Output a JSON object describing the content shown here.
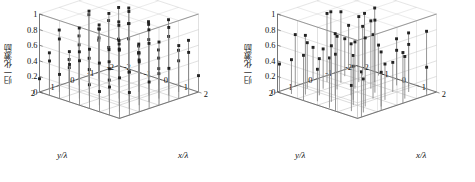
{
  "figure": {
    "background_color": "#ffffff",
    "panel_count": 2,
    "marker_color": "#222222",
    "stem_color": "#8a8a8a",
    "grid_color": "#b9b9b9",
    "axis_color": "#4a4a4a"
  },
  "chart_data": [
    {
      "type": "scatter",
      "panel": "left",
      "title": "",
      "xlabel": "x/λ",
      "ylabel": "y/λ",
      "zlabel": "归一化激励",
      "xlim": [
        -2,
        2
      ],
      "ylim": [
        -2,
        2
      ],
      "zlim": [
        0,
        1
      ],
      "xticks": [
        -2,
        -1,
        0,
        1,
        2
      ],
      "yticks": [
        -2,
        -1,
        0,
        1,
        2
      ],
      "zticks": [
        0,
        0.2,
        0.4,
        0.6,
        0.8,
        1
      ],
      "xticklabels": [
        "-2",
        "-1",
        "0",
        "1",
        "2"
      ],
      "yticklabels": [
        "-2",
        "-1",
        "0",
        "1",
        "2"
      ],
      "zticklabels": [
        "0",
        "0.2",
        "0.4",
        "0.6",
        "0.8",
        "1"
      ],
      "grid": true,
      "legend": "none",
      "points": [
        [
          -2.0,
          -2.0,
          0.34
        ],
        [
          -2.0,
          -1.5,
          0.62
        ],
        [
          -2.0,
          -1.0,
          0.41
        ],
        [
          -2.0,
          -0.5,
          0.78
        ],
        [
          -2.0,
          0.0,
          0.55
        ],
        [
          -2.0,
          0.5,
          0.29
        ],
        [
          -2.0,
          1.0,
          0.71
        ],
        [
          -2.0,
          1.5,
          0.46
        ],
        [
          -2.0,
          2.0,
          0.17
        ],
        [
          -1.5,
          -2.0,
          0.58
        ],
        [
          -1.5,
          -1.5,
          0.83
        ],
        [
          -1.5,
          -1.0,
          0.36
        ],
        [
          -1.5,
          -0.5,
          0.64
        ],
        [
          -1.5,
          0.0,
          0.91
        ],
        [
          -1.5,
          0.5,
          0.52
        ],
        [
          -1.5,
          1.0,
          0.27
        ],
        [
          -1.5,
          1.5,
          0.68
        ],
        [
          -1.5,
          2.0,
          0.44
        ],
        [
          -1.0,
          -2.0,
          0.25
        ],
        [
          -1.0,
          -1.5,
          0.47
        ],
        [
          -1.0,
          -1.0,
          0.73
        ],
        [
          -1.0,
          -0.5,
          0.88
        ],
        [
          -1.0,
          0.0,
          0.61
        ],
        [
          -1.0,
          0.5,
          0.39
        ],
        [
          -1.0,
          1.0,
          0.82
        ],
        [
          -1.0,
          1.5,
          0.56
        ],
        [
          -1.0,
          2.0,
          0.31
        ],
        [
          -0.5,
          -2.0,
          0.69
        ],
        [
          -0.5,
          -1.5,
          0.42
        ],
        [
          -0.5,
          -1.0,
          0.95
        ],
        [
          -0.5,
          -0.5,
          0.77
        ],
        [
          -0.5,
          0.0,
          0.5
        ],
        [
          -0.5,
          0.5,
          0.86
        ],
        [
          -0.5,
          1.0,
          0.33
        ],
        [
          -0.5,
          1.5,
          0.6
        ],
        [
          -0.5,
          2.0,
          0.48
        ],
        [
          0.0,
          -2.0,
          0.37
        ],
        [
          0.0,
          -1.5,
          0.74
        ],
        [
          0.0,
          -1.0,
          0.53
        ],
        [
          0.0,
          -0.5,
          0.99
        ],
        [
          0.0,
          0.0,
          0.66
        ],
        [
          0.0,
          0.5,
          0.43
        ],
        [
          0.0,
          1.0,
          0.89
        ],
        [
          0.0,
          1.5,
          0.22
        ],
        [
          0.0,
          2.0,
          0.57
        ],
        [
          0.5,
          -2.0,
          0.8
        ],
        [
          0.5,
          -1.5,
          0.35
        ],
        [
          0.5,
          -1.0,
          0.63
        ],
        [
          0.5,
          -0.5,
          0.49
        ],
        [
          0.5,
          0.0,
          0.92
        ],
        [
          0.5,
          0.5,
          0.7
        ],
        [
          0.5,
          1.0,
          0.28
        ],
        [
          0.5,
          1.5,
          0.54
        ],
        [
          0.5,
          2.0,
          0.76
        ],
        [
          1.0,
          -2.0,
          0.45
        ],
        [
          1.0,
          -1.5,
          0.67
        ],
        [
          1.0,
          -1.0,
          0.3
        ],
        [
          1.0,
          -0.5,
          0.84
        ],
        [
          1.0,
          0.0,
          0.59
        ],
        [
          1.0,
          0.5,
          0.38
        ],
        [
          1.0,
          1.0,
          0.72
        ],
        [
          1.0,
          1.5,
          0.51
        ],
        [
          1.0,
          2.0,
          0.26
        ],
        [
          1.5,
          -2.0,
          0.62
        ],
        [
          1.5,
          -1.5,
          0.4
        ],
        [
          1.5,
          -1.0,
          0.87
        ],
        [
          1.5,
          -0.5,
          0.32
        ],
        [
          1.5,
          0.0,
          0.75
        ],
        [
          1.5,
          0.5,
          0.58
        ],
        [
          1.5,
          1.0,
          0.47
        ],
        [
          1.5,
          1.5,
          0.79
        ],
        [
          1.5,
          2.0,
          0.36
        ],
        [
          2.0,
          -2.0,
          0.21
        ],
        [
          2.0,
          -1.5,
          0.55
        ],
        [
          2.0,
          -1.0,
          0.68
        ],
        [
          2.0,
          -0.5,
          0.43
        ],
        [
          2.0,
          0.0,
          0.81
        ],
        [
          2.0,
          0.5,
          0.34
        ],
        [
          2.0,
          1.0,
          0.64
        ],
        [
          2.0,
          1.5,
          0.29
        ],
        [
          2.0,
          2.0,
          0.52
        ]
      ]
    },
    {
      "type": "scatter",
      "panel": "right",
      "title": "",
      "xlabel": "x/λ",
      "ylabel": "y/λ",
      "zlabel": "归一化激励",
      "xlim": [
        -2,
        2
      ],
      "ylim": [
        -2,
        2
      ],
      "zlim": [
        0,
        1
      ],
      "xticks": [
        -2,
        -1,
        0,
        1,
        2
      ],
      "yticks": [
        -2,
        -1,
        0,
        1,
        2
      ],
      "zticks": [
        0,
        0.2,
        0.4,
        0.6,
        0.8,
        1
      ],
      "xticklabels": [
        "-2",
        "-1",
        "0",
        "1",
        "2"
      ],
      "yticklabels": [
        "-2",
        "-1",
        "0",
        "1",
        "2"
      ],
      "zticklabels": [
        "0",
        "0.2",
        "0.4",
        "0.6",
        "0.8",
        "1"
      ],
      "grid": true,
      "legend": "none",
      "points": [
        [
          -2.0,
          -1.6,
          0.55
        ],
        [
          -2.0,
          -0.7,
          0.8
        ],
        [
          -2.0,
          0.2,
          0.42
        ],
        [
          -2.0,
          1.1,
          0.66
        ],
        [
          -2.0,
          1.9,
          0.35
        ],
        [
          -1.5,
          -1.9,
          0.72
        ],
        [
          -1.5,
          -0.9,
          0.48
        ],
        [
          -1.5,
          0.0,
          0.88
        ],
        [
          -1.5,
          1.0,
          0.59
        ],
        [
          -1.5,
          1.8,
          0.44
        ],
        [
          -1.1,
          -1.4,
          0.63
        ],
        [
          -1.1,
          -0.3,
          0.91
        ],
        [
          -1.1,
          0.6,
          0.51
        ],
        [
          -1.1,
          1.5,
          0.76
        ],
        [
          -0.7,
          -1.8,
          0.39
        ],
        [
          -0.7,
          -0.8,
          0.84
        ],
        [
          -0.7,
          0.3,
          0.68
        ],
        [
          -0.7,
          1.2,
          0.47
        ],
        [
          -0.7,
          2.0,
          0.58
        ],
        [
          -0.3,
          -1.2,
          0.95
        ],
        [
          -0.3,
          -0.2,
          0.6
        ],
        [
          -0.3,
          0.8,
          0.79
        ],
        [
          -0.3,
          1.7,
          0.41
        ],
        [
          0.1,
          -1.9,
          0.53
        ],
        [
          0.1,
          -0.6,
          0.87
        ],
        [
          0.1,
          0.4,
          0.66
        ],
        [
          0.1,
          1.4,
          0.72
        ],
        [
          0.5,
          -1.5,
          0.45
        ],
        [
          0.5,
          -0.4,
          0.93
        ],
        [
          0.5,
          0.7,
          0.57
        ],
        [
          0.5,
          1.9,
          0.64
        ],
        [
          0.9,
          -1.7,
          0.69
        ],
        [
          0.9,
          -0.9,
          0.38
        ],
        [
          0.9,
          0.1,
          0.82
        ],
        [
          0.9,
          1.1,
          0.5
        ],
        [
          0.9,
          2.0,
          0.73
        ],
        [
          1.3,
          -1.3,
          0.61
        ],
        [
          1.3,
          -0.1,
          0.46
        ],
        [
          1.3,
          0.9,
          0.88
        ],
        [
          1.3,
          1.6,
          0.33
        ],
        [
          1.7,
          -1.8,
          0.77
        ],
        [
          1.7,
          -0.7,
          0.54
        ],
        [
          1.7,
          0.5,
          0.7
        ],
        [
          1.7,
          1.4,
          0.43
        ],
        [
          2.0,
          -1.5,
          0.36
        ],
        [
          2.0,
          -0.3,
          0.65
        ],
        [
          2.0,
          0.8,
          0.49
        ],
        [
          2.0,
          1.8,
          0.58
        ]
      ]
    }
  ]
}
